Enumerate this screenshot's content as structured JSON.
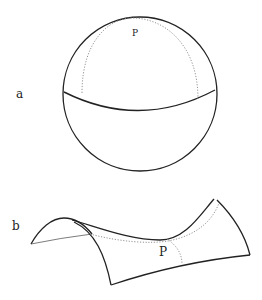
{
  "figure": {
    "panels": [
      {
        "id": "a",
        "label": "a",
        "shape": "sphere",
        "point_label": "P",
        "description": "Sphere with equator curve and dotted great-circle arc through point P (positive curvature)"
      },
      {
        "id": "b",
        "label": "b",
        "shape": "saddle surface",
        "point_label": "P",
        "description": "Saddle-shaped surface with dotted curves crossing at point P (negative curvature)"
      }
    ]
  },
  "colors": {
    "stroke": "#222222",
    "dotted": "#888888",
    "background": "#ffffff"
  }
}
